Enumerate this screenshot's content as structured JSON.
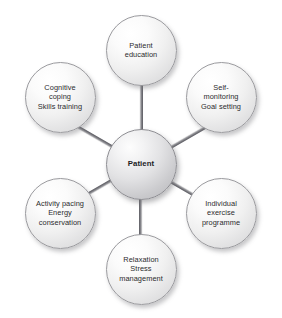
{
  "diagram": {
    "type": "radial-hub-and-spoke",
    "background_color": "#ffffff",
    "node_fill_light": "#ffffff",
    "node_fill_dark": "#d2d2d4",
    "node_stroke_color": "#9a9a9e",
    "spoke_color": "#74747a",
    "label_color": "#2b2b2d",
    "center": {
      "id": "patient",
      "label": "Patient",
      "x": 141,
      "y": 164,
      "diameter": 71
    },
    "satellites": [
      {
        "id": "patient-education",
        "label": "Patient\neducation",
        "angle_deg": 270,
        "x": 141,
        "y": 50,
        "diameter": 71
      },
      {
        "id": "self-monitoring-goal-setting",
        "label": "Self-\nmonitoring\nGoal setting",
        "angle_deg": 330,
        "x": 221,
        "y": 97,
        "diameter": 71
      },
      {
        "id": "individual-exercise-programme",
        "label": "Individual\nexercise\nprogramme",
        "angle_deg": 30,
        "x": 221,
        "y": 213,
        "diameter": 71
      },
      {
        "id": "relaxation-stress-management",
        "label": "Relaxation\nStress\nmanagement",
        "angle_deg": 90,
        "x": 141,
        "y": 269,
        "diameter": 71
      },
      {
        "id": "activity-pacing-energy-conservation",
        "label": "Activity pacing\nEnergy\nconservation",
        "angle_deg": 150,
        "x": 60,
        "y": 213,
        "diameter": 71
      },
      {
        "id": "cognitive-coping-skills-training",
        "label": "Cognitive\ncoping\nSkills training",
        "angle_deg": 210,
        "x": 60,
        "y": 97,
        "diameter": 71
      }
    ],
    "spokes": [
      {
        "id": "spoke-to-patient-education",
        "angle_deg": 270,
        "length": 80
      },
      {
        "id": "spoke-to-self-monitoring-goal-setting",
        "angle_deg": 330,
        "length": 80
      },
      {
        "id": "spoke-to-individual-exercise-programme",
        "angle_deg": 30,
        "length": 80
      },
      {
        "id": "spoke-to-relaxation-stress-management",
        "angle_deg": 90,
        "length": 80
      },
      {
        "id": "spoke-to-activity-pacing-energy-conservation",
        "angle_deg": 150,
        "length": 80
      },
      {
        "id": "spoke-to-cognitive-coping-skills-training",
        "angle_deg": 210,
        "length": 80
      }
    ]
  }
}
